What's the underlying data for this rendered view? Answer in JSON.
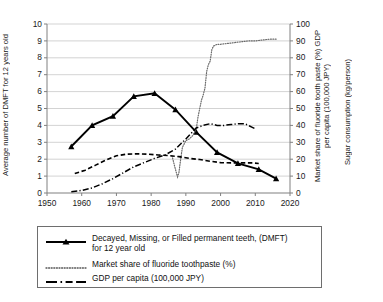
{
  "chart_data": {
    "type": "line",
    "title": "",
    "xlabel": "",
    "xlim": [
      1950,
      2020
    ],
    "xticks": [
      "1950",
      "1960",
      "1970",
      "1980",
      "1990",
      "2000",
      "2010",
      "2020"
    ],
    "xtick_values": [
      1950,
      1960,
      1970,
      1980,
      1990,
      2000,
      2010,
      2020
    ],
    "ylabel_left": "Average number of DMFT for 12 years old",
    "ylim_left": [
      0,
      10
    ],
    "yticks_left": [
      "0",
      "1",
      "2",
      "3",
      "4",
      "5",
      "6",
      "7",
      "8",
      "9",
      "10"
    ],
    "ytick_values_left": [
      0,
      1,
      2,
      3,
      4,
      5,
      6,
      7,
      8,
      9,
      10
    ],
    "ylabel_right_a": "Market share of fluoride tooth paste (%) GDP\nper capita (100,000 JPY)",
    "ylabel_right_b": "Sugar consumption (kg/person)",
    "ylim_right": [
      0,
      100
    ],
    "yticks_right": [
      "0",
      "10",
      "20",
      "30",
      "40",
      "50",
      "60",
      "70",
      "80",
      "90",
      "100"
    ],
    "ytick_values_right": [
      0,
      10,
      20,
      30,
      40,
      50,
      60,
      70,
      80,
      90,
      100
    ],
    "grid": "horizontal",
    "legend_position": "below",
    "series": [
      {
        "name": "Decayed, Missing, or Filled permanent teeth, (DMFT)\nfor 12 year old",
        "axis": "left",
        "style": "solid-marker-triangle",
        "color": "#000000",
        "x": [
          1957,
          1963,
          1969,
          1975,
          1981,
          1987,
          1993,
          1999,
          2005,
          2011,
          2016
        ],
        "y": [
          2.75,
          4.0,
          4.55,
          5.72,
          5.9,
          4.93,
          3.6,
          2.4,
          1.75,
          1.4,
          0.85
        ]
      },
      {
        "name": "Market share of fluoride toothpaste (%)",
        "axis": "right",
        "style": "dotted",
        "color": "#6a6a6a",
        "x": [
          1986,
          1987,
          1987.6,
          1988,
          1988.5,
          1989,
          1990,
          1991,
          1992,
          1993,
          1993.5,
          1994,
          1994.5,
          1995,
          1995.5,
          1996,
          1996.5,
          1997,
          1997.5,
          1998,
          1999,
          2000,
          2002,
          2004,
          2006,
          2008,
          2010,
          2012,
          2014,
          2016
        ],
        "y": [
          22,
          14,
          9.5,
          12,
          20,
          27,
          31,
          32,
          34,
          38,
          45,
          50,
          55,
          58,
          62,
          72,
          76,
          78,
          85,
          87,
          88,
          88,
          88.5,
          89,
          89.5,
          90,
          90,
          90.5,
          91,
          91
        ]
      },
      {
        "name": "GDP per capita (100,000 JPY)",
        "axis": "right",
        "style": "dash-dot",
        "color": "#000000",
        "x": [
          1957,
          1960,
          1963,
          1966,
          1969,
          1972,
          1975,
          1978,
          1981,
          1984,
          1987,
          1990,
          1993,
          1995,
          1997,
          1999,
          2001,
          2003,
          2005,
          2007,
          2009,
          2010
        ],
        "y": [
          0.8,
          1.5,
          3.0,
          5.5,
          8.5,
          12.0,
          15.5,
          18.0,
          20.5,
          22.5,
          26.0,
          32.0,
          38.5,
          40.0,
          41.0,
          40.0,
          40.0,
          40.5,
          41.0,
          41.0,
          39.0,
          38.0
        ]
      },
      {
        "name": "Sugar consumption (kg/person)",
        "axis": "right",
        "style": "dashed",
        "color": "#000000",
        "x": [
          1958,
          1961,
          1964,
          1967,
          1970,
          1973,
          1976,
          1979,
          1982,
          1985,
          1988,
          1991,
          1994,
          1997,
          2000,
          2003,
          2006,
          2009,
          2011
        ],
        "y": [
          11.5,
          13.5,
          16.5,
          19.5,
          22.0,
          23.0,
          23.2,
          23.0,
          22.5,
          22.2,
          21.5,
          20.5,
          19.8,
          18.8,
          18.0,
          17.8,
          17.8,
          17.8,
          17.5
        ]
      }
    ]
  },
  "legend": {
    "items": [
      {
        "label": "Decayed, Missing, or Filled permanent teeth, (DMFT)\nfor 12 year old",
        "symbol": "solid-line-triangle-marker"
      },
      {
        "label": "Market share of fluoride toothpaste (%)",
        "symbol": "dotted-line"
      },
      {
        "label": "GDP per capita (100,000 JPY)",
        "symbol": "dash-dot-line"
      }
    ]
  }
}
